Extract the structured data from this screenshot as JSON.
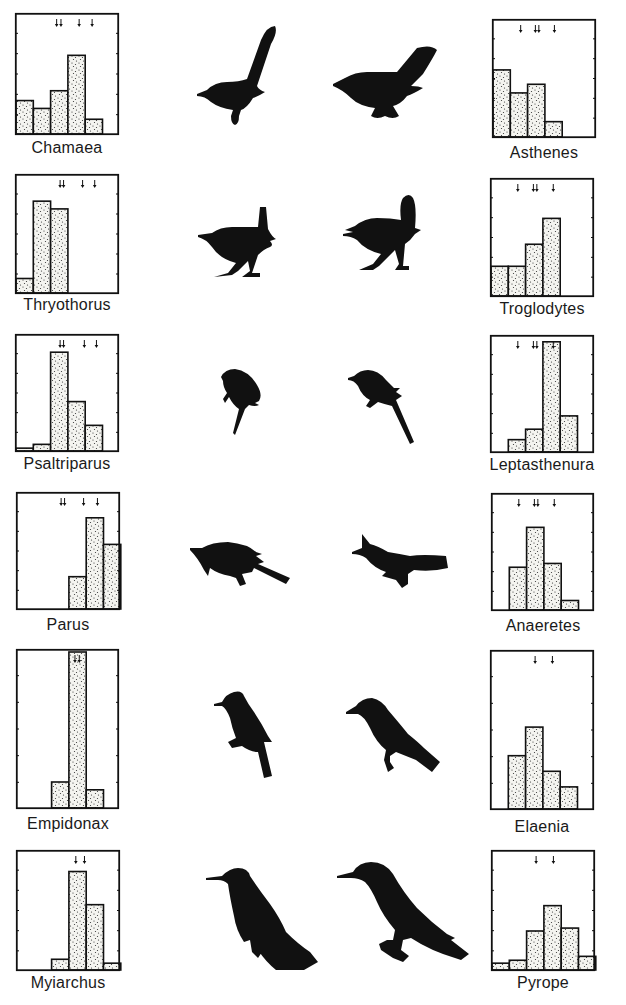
{
  "figure": {
    "bar_fill": "#f4f4f0",
    "ink": "#111111",
    "background": "#ffffff"
  },
  "chart_data": [
    {
      "type": "bar",
      "title": "Chamaea",
      "side": "left",
      "row": 1,
      "bin_count": 6,
      "values": [
        34,
        26,
        44,
        80,
        15,
        0
      ],
      "ylim": [
        0,
        120
      ],
      "arrows": [
        2.35,
        2.6,
        3.65,
        4.4
      ]
    },
    {
      "type": "bar",
      "title": "Asthenes",
      "side": "right",
      "row": 1,
      "bin_count": 6,
      "values": [
        70,
        46,
        55,
        16,
        0,
        0
      ],
      "ylim": [
        0,
        120
      ],
      "arrows": [
        1.6,
        2.45,
        2.65,
        3.55
      ]
    },
    {
      "type": "bar",
      "title": "Thryothorus",
      "side": "left",
      "row": 2,
      "bin_count": 6,
      "values": [
        15,
        95,
        87,
        0,
        0,
        0
      ],
      "ylim": [
        0,
        120
      ],
      "arrows": [
        2.55,
        2.75,
        3.85,
        4.55
      ]
    },
    {
      "type": "bar",
      "title": "Troglodytes",
      "side": "right",
      "row": 2,
      "bin_count": 6,
      "values": [
        31,
        31,
        54,
        81,
        0,
        0
      ],
      "ylim": [
        0,
        120
      ],
      "arrows": [
        1.55,
        2.45,
        2.65,
        3.6
      ]
    },
    {
      "type": "bar",
      "title": "Psaltriparus",
      "side": "left",
      "row": 3,
      "bin_count": 6,
      "values": [
        3,
        7,
        104,
        52,
        27,
        0
      ],
      "ylim": [
        0,
        120
      ],
      "arrows": [
        2.55,
        2.75,
        3.95,
        4.65
      ]
    },
    {
      "type": "bar",
      "title": "Leptasthenura",
      "side": "right",
      "row": 3,
      "bin_count": 6,
      "values": [
        0,
        13,
        24,
        116,
        38,
        0
      ],
      "ylim": [
        0,
        120
      ],
      "arrows": [
        1.55,
        2.45,
        2.65,
        3.6
      ]
    },
    {
      "type": "bar",
      "title": "Parus",
      "side": "left",
      "row": 4,
      "bin_count": 6,
      "values": [
        0,
        0,
        0,
        34,
        96,
        68
      ],
      "ylim": [
        0,
        120
      ],
      "arrows": [
        2.55,
        2.75,
        3.85,
        4.65
      ]
    },
    {
      "type": "bar",
      "title": "Anaeretes",
      "side": "right",
      "row": 4,
      "bin_count": 6,
      "values": [
        0,
        45,
        87,
        49,
        10,
        0
      ],
      "ylim": [
        0,
        120
      ],
      "arrows": [
        1.55,
        2.45,
        2.65,
        3.6
      ]
    },
    {
      "type": "bar",
      "title": "Empidonax",
      "side": "left",
      "row": 5,
      "bin_count": 6,
      "values": [
        0,
        0,
        20,
        120,
        14,
        0
      ],
      "ylim": [
        0,
        120
      ],
      "arrows": [
        3.35,
        3.6
      ]
    },
    {
      "type": "bar",
      "title": "Elaenia",
      "side": "right",
      "row": 5,
      "bin_count": 6,
      "values": [
        0,
        41,
        63,
        29,
        17,
        0
      ],
      "ylim": [
        0,
        120
      ],
      "arrows": [
        2.55,
        3.55
      ]
    },
    {
      "type": "bar",
      "title": "Myiarchus",
      "side": "left",
      "row": 6,
      "bin_count": 6,
      "values": [
        0,
        0,
        11,
        101,
        67,
        7
      ],
      "ylim": [
        0,
        120
      ],
      "arrows": [
        3.4,
        3.9
      ]
    },
    {
      "type": "bar",
      "title": "Pyrope",
      "side": "right",
      "row": 6,
      "bin_count": 6,
      "values": [
        7,
        10,
        40,
        66,
        43,
        14
      ],
      "ylim": [
        0,
        120
      ],
      "arrows": [
        2.55,
        3.55
      ]
    }
  ],
  "birds": [
    {
      "row": 1,
      "left_icon": "wrentit-long-tail-bird-icon",
      "right_icon": "canastero-fan-tail-bird-icon"
    },
    {
      "row": 2,
      "left_icon": "wren-cocked-tail-bird-icon",
      "right_icon": "wren-round-tail-bird-icon"
    },
    {
      "row": 3,
      "left_icon": "bushtit-perched-bird-icon",
      "right_icon": "tit-spinetail-bird-icon"
    },
    {
      "row": 4,
      "left_icon": "titmouse-crested-bird-icon",
      "right_icon": "tit-tyrant-crested-bird-icon"
    },
    {
      "row": 5,
      "left_icon": "flycatcher-perched-bird-icon",
      "right_icon": "elaenia-perched-bird-icon"
    },
    {
      "row": 6,
      "left_icon": "myiarchus-perched-bird-icon",
      "right_icon": "pyrope-perched-bird-icon"
    }
  ]
}
